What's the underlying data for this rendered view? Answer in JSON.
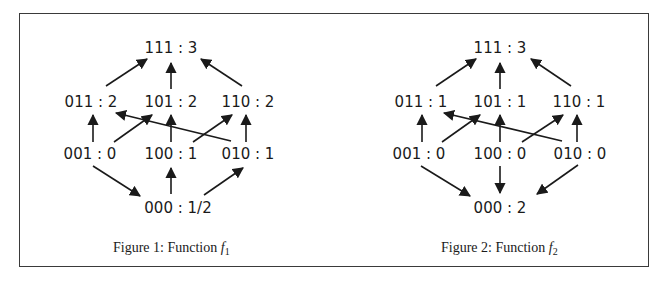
{
  "figures": [
    {
      "id": "f1",
      "caption": {
        "prefix": "Figure 1:  Function ",
        "func": "f",
        "sub": "1"
      },
      "nodes": {
        "111": {
          "label": "111 : 3"
        },
        "011": {
          "label": "011 : 2"
        },
        "101": {
          "label": "101 : 2"
        },
        "110": {
          "label": "110 : 2"
        },
        "001": {
          "label": "001 : 0"
        },
        "100": {
          "label": "100 : 1"
        },
        "010": {
          "label": "010 : 1"
        },
        "000": {
          "label": "000 : 1/2"
        }
      },
      "edges": [
        {
          "from": "011",
          "to": "111"
        },
        {
          "from": "101",
          "to": "111"
        },
        {
          "from": "110",
          "to": "111"
        },
        {
          "from": "001",
          "to": "011"
        },
        {
          "from": "001",
          "to": "101"
        },
        {
          "from": "100",
          "to": "101"
        },
        {
          "from": "100",
          "to": "110"
        },
        {
          "from": "010",
          "to": "011"
        },
        {
          "from": "010",
          "to": "110"
        },
        {
          "from": "001",
          "to": "000"
        },
        {
          "from": "000",
          "to": "100"
        },
        {
          "from": "000",
          "to": "010"
        }
      ]
    },
    {
      "id": "f2",
      "caption": {
        "prefix": "Figure 2:  Function ",
        "func": "f",
        "sub": "2"
      },
      "nodes": {
        "111": {
          "label": "111 : 3"
        },
        "011": {
          "label": "011 : 1"
        },
        "101": {
          "label": "101 : 1"
        },
        "110": {
          "label": "110 : 1"
        },
        "001": {
          "label": "001 : 0"
        },
        "100": {
          "label": "100 : 0"
        },
        "010": {
          "label": "010 : 0"
        },
        "000": {
          "label": "000 : 2"
        }
      },
      "edges": [
        {
          "from": "011",
          "to": "111"
        },
        {
          "from": "101",
          "to": "111"
        },
        {
          "from": "110",
          "to": "111"
        },
        {
          "from": "001",
          "to": "011"
        },
        {
          "from": "001",
          "to": "101"
        },
        {
          "from": "100",
          "to": "101"
        },
        {
          "from": "100",
          "to": "110"
        },
        {
          "from": "010",
          "to": "011"
        },
        {
          "from": "010",
          "to": "110"
        },
        {
          "from": "001",
          "to": "000"
        },
        {
          "from": "100",
          "to": "000"
        },
        {
          "from": "010",
          "to": "000"
        }
      ]
    }
  ]
}
